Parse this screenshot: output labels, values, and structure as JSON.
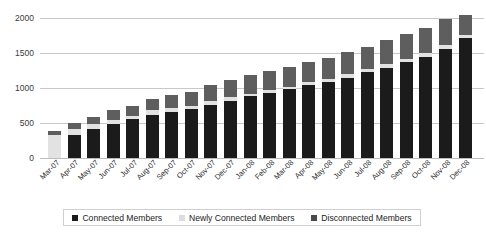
{
  "chart_data": {
    "type": "bar",
    "subtype": "stacked-column",
    "title": "",
    "xlabel": "",
    "ylabel": "",
    "ylim": [
      0,
      2000
    ],
    "yticks": [
      0,
      500,
      1000,
      1500,
      2000
    ],
    "grid": true,
    "legend_position": "bottom",
    "categories": [
      "Mar-07",
      "Apr-07",
      "May-07",
      "Jun-07",
      "Jul-07",
      "Aug-07",
      "Sep-07",
      "Oct-07",
      "Nov-07",
      "Dec-07",
      "Jan-08",
      "Feb-08",
      "Mar-08",
      "Apr-08",
      "May-08",
      "Jun-08",
      "Jul-08",
      "Aug-08",
      "Sep-08",
      "Oct-08",
      "Nov-08",
      "Dec-08"
    ],
    "series": [
      {
        "name": "Connected Members",
        "color": "#1b1b1b",
        "values": [
          0,
          330,
          420,
          480,
          560,
          620,
          660,
          700,
          760,
          820,
          880,
          930,
          980,
          1040,
          1090,
          1150,
          1230,
          1290,
          1370,
          1450,
          1560,
          1720
        ]
      },
      {
        "name": "Newly Connected Members",
        "color": "#e2e2e2",
        "values": [
          330,
          90,
          60,
          60,
          40,
          60,
          50,
          40,
          50,
          50,
          40,
          40,
          40,
          40,
          40,
          50,
          40,
          50,
          50,
          50,
          50,
          40
        ]
      },
      {
        "name": "Disconnected Members",
        "color": "#5e5e5e",
        "values": [
          50,
          80,
          110,
          140,
          150,
          170,
          190,
          210,
          230,
          240,
          260,
          270,
          280,
          290,
          300,
          310,
          320,
          340,
          350,
          360,
          370,
          290
        ]
      }
    ],
    "totals": [
      380,
      500,
      590,
      680,
      750,
      850,
      900,
      950,
      1040,
      1110,
      1180,
      1240,
      1300,
      1370,
      1430,
      1510,
      1590,
      1680,
      1770,
      1860,
      1980,
      2050
    ]
  },
  "yaxis": {
    "ticks": [
      "0",
      "500",
      "1000",
      "1500",
      "2000"
    ]
  },
  "legend": {
    "items": [
      {
        "label": "Connected Members",
        "swatch": "legend-swatch-connected"
      },
      {
        "label": "Newly Connected Members",
        "swatch": "legend-swatch-newly"
      },
      {
        "label": "Disconnected Members",
        "swatch": "legend-swatch-disconnected"
      }
    ]
  },
  "colors": {
    "connected": "#1b1b1b",
    "newly": "#e2e2e2",
    "disconnected": "#5e5e5e",
    "gridline": "#c8c8c8",
    "background": "#ffffff",
    "text": "#2e2e2e"
  }
}
